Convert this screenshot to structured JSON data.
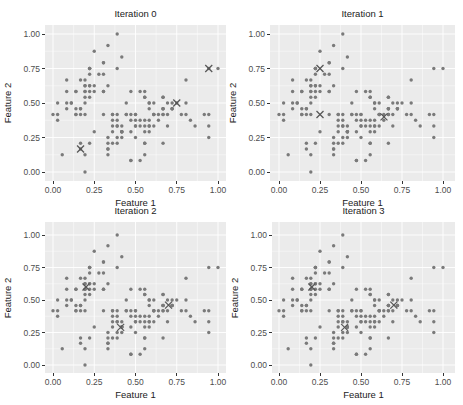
{
  "chart_data": {
    "type": "scatter",
    "layout": "2x2 small multiples",
    "xlabel": "Feature 1",
    "ylabel": "Feature 2",
    "xlim": [
      -0.05,
      1.05
    ],
    "ylim": [
      -0.06,
      1.06
    ],
    "xticks": [
      "0.00",
      "0.25",
      "0.50",
      "0.75",
      "1.00"
    ],
    "yticks": [
      "0.00",
      "0.25",
      "0.50",
      "0.75",
      "1.00"
    ],
    "grid": true,
    "background": "#ebebeb",
    "point_color": "#7a7a7a",
    "centroid_color": "#555555",
    "points": [
      [
        0.222,
        0.625
      ],
      [
        0.167,
        0.417
      ],
      [
        0.111,
        0.5
      ],
      [
        0.083,
        0.458
      ],
      [
        0.194,
        0.667
      ],
      [
        0.306,
        0.792
      ],
      [
        0.083,
        0.583
      ],
      [
        0.194,
        0.583
      ],
      [
        0.028,
        0.375
      ],
      [
        0.167,
        0.458
      ],
      [
        0.306,
        0.708
      ],
      [
        0.139,
        0.583
      ],
      [
        0.139,
        0.417
      ],
      [
        0.0,
        0.417
      ],
      [
        0.417,
        0.833
      ],
      [
        0.389,
        1.0
      ],
      [
        0.306,
        0.792
      ],
      [
        0.222,
        0.625
      ],
      [
        0.389,
        0.75
      ],
      [
        0.222,
        0.75
      ],
      [
        0.306,
        0.583
      ],
      [
        0.222,
        0.708
      ],
      [
        0.083,
        0.667
      ],
      [
        0.222,
        0.542
      ],
      [
        0.139,
        0.583
      ],
      [
        0.194,
        0.417
      ],
      [
        0.194,
        0.583
      ],
      [
        0.25,
        0.625
      ],
      [
        0.25,
        0.583
      ],
      [
        0.111,
        0.5
      ],
      [
        0.139,
        0.458
      ],
      [
        0.306,
        0.583
      ],
      [
        0.25,
        0.875
      ],
      [
        0.333,
        0.917
      ],
      [
        0.167,
        0.458
      ],
      [
        0.194,
        0.5
      ],
      [
        0.333,
        0.625
      ],
      [
        0.167,
        0.667
      ],
      [
        0.028,
        0.417
      ],
      [
        0.222,
        0.583
      ],
      [
        0.194,
        0.625
      ],
      [
        0.056,
        0.125
      ],
      [
        0.028,
        0.5
      ],
      [
        0.194,
        0.625
      ],
      [
        0.222,
        0.75
      ],
      [
        0.139,
        0.417
      ],
      [
        0.222,
        0.75
      ],
      [
        0.083,
        0.5
      ],
      [
        0.278,
        0.708
      ],
      [
        0.194,
        0.542
      ],
      [
        0.75,
        0.5
      ],
      [
        0.583,
        0.5
      ],
      [
        0.722,
        0.458
      ],
      [
        0.333,
        0.125
      ],
      [
        0.611,
        0.333
      ],
      [
        0.389,
        0.333
      ],
      [
        0.556,
        0.542
      ],
      [
        0.167,
        0.167
      ],
      [
        0.639,
        0.375
      ],
      [
        0.25,
        0.292
      ],
      [
        0.194,
        0.0
      ],
      [
        0.444,
        0.417
      ],
      [
        0.472,
        0.083
      ],
      [
        0.5,
        0.375
      ],
      [
        0.361,
        0.375
      ],
      [
        0.667,
        0.458
      ],
      [
        0.361,
        0.417
      ],
      [
        0.417,
        0.292
      ],
      [
        0.528,
        0.083
      ],
      [
        0.361,
        0.208
      ],
      [
        0.444,
        0.5
      ],
      [
        0.5,
        0.333
      ],
      [
        0.556,
        0.208
      ],
      [
        0.5,
        0.333
      ],
      [
        0.583,
        0.375
      ],
      [
        0.639,
        0.417
      ],
      [
        0.694,
        0.333
      ],
      [
        0.667,
        0.417
      ],
      [
        0.472,
        0.375
      ],
      [
        0.389,
        0.25
      ],
      [
        0.333,
        0.167
      ],
      [
        0.333,
        0.167
      ],
      [
        0.417,
        0.292
      ],
      [
        0.472,
        0.292
      ],
      [
        0.306,
        0.417
      ],
      [
        0.472,
        0.583
      ],
      [
        0.667,
        0.458
      ],
      [
        0.556,
        0.125
      ],
      [
        0.361,
        0.417
      ],
      [
        0.333,
        0.208
      ],
      [
        0.333,
        0.25
      ],
      [
        0.5,
        0.417
      ],
      [
        0.417,
        0.25
      ],
      [
        0.194,
        0.125
      ],
      [
        0.361,
        0.292
      ],
      [
        0.389,
        0.417
      ],
      [
        0.389,
        0.375
      ],
      [
        0.528,
        0.375
      ],
      [
        0.222,
        0.208
      ],
      [
        0.389,
        0.333
      ],
      [
        0.556,
        0.542
      ],
      [
        0.417,
        0.292
      ],
      [
        0.778,
        0.417
      ],
      [
        0.556,
        0.375
      ],
      [
        0.611,
        0.417
      ],
      [
        0.917,
        0.417
      ],
      [
        0.167,
        0.208
      ],
      [
        0.833,
        0.375
      ],
      [
        0.667,
        0.208
      ],
      [
        0.806,
        0.667
      ],
      [
        0.611,
        0.5
      ],
      [
        0.583,
        0.292
      ],
      [
        0.694,
        0.417
      ],
      [
        0.389,
        0.208
      ],
      [
        0.417,
        0.333
      ],
      [
        0.583,
        0.5
      ],
      [
        0.611,
        0.417
      ],
      [
        0.944,
        0.75
      ],
      [
        0.944,
        0.25
      ],
      [
        0.472,
        0.083
      ],
      [
        0.722,
        0.5
      ],
      [
        0.361,
        0.333
      ],
      [
        0.944,
        0.333
      ],
      [
        0.556,
        0.292
      ],
      [
        0.667,
        0.542
      ],
      [
        0.806,
        0.5
      ],
      [
        0.528,
        0.333
      ],
      [
        0.5,
        0.417
      ],
      [
        0.583,
        0.333
      ],
      [
        0.806,
        0.417
      ],
      [
        0.861,
        0.333
      ],
      [
        1.0,
        0.75
      ],
      [
        0.583,
        0.333
      ],
      [
        0.556,
        0.333
      ],
      [
        0.5,
        0.25
      ],
      [
        0.944,
        0.417
      ],
      [
        0.556,
        0.583
      ],
      [
        0.583,
        0.458
      ],
      [
        0.472,
        0.417
      ],
      [
        0.722,
        0.458
      ],
      [
        0.667,
        0.458
      ],
      [
        0.722,
        0.458
      ],
      [
        0.417,
        0.292
      ],
      [
        0.694,
        0.5
      ],
      [
        0.667,
        0.542
      ],
      [
        0.667,
        0.417
      ],
      [
        0.556,
        0.208
      ],
      [
        0.611,
        0.417
      ],
      [
        0.528,
        0.583
      ],
      [
        0.444,
        0.417
      ]
    ],
    "panels": [
      {
        "title": "Iteration 0",
        "centroids": [
          [
            0.167,
            0.167
          ],
          [
            0.75,
            0.5
          ],
          [
            0.944,
            0.75
          ]
        ]
      },
      {
        "title": "Iteration 1",
        "centroids": [
          [
            0.25,
            0.75
          ],
          [
            0.25,
            0.417
          ],
          [
            0.64,
            0.4
          ]
        ]
      },
      {
        "title": "Iteration 2",
        "centroids": [
          [
            0.2,
            0.6
          ],
          [
            0.41,
            0.29
          ],
          [
            0.7,
            0.46
          ]
        ]
      },
      {
        "title": "Iteration 3",
        "centroids": [
          [
            0.2,
            0.6
          ],
          [
            0.4,
            0.29
          ],
          [
            0.7,
            0.46
          ]
        ]
      }
    ]
  }
}
